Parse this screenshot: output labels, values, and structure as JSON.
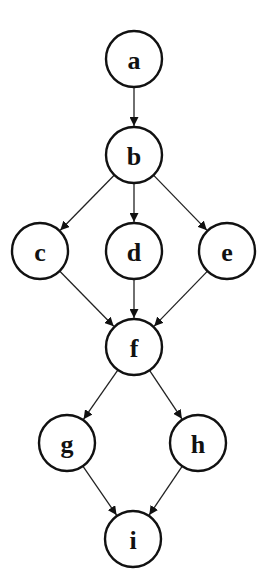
{
  "diagram": {
    "type": "directed-graph",
    "nodes": [
      {
        "id": "a",
        "label": "a",
        "x": 134,
        "y": 59
      },
      {
        "id": "b",
        "label": "b",
        "x": 134,
        "y": 155
      },
      {
        "id": "c",
        "label": "c",
        "x": 40,
        "y": 251
      },
      {
        "id": "d",
        "label": "d",
        "x": 134,
        "y": 251
      },
      {
        "id": "e",
        "label": "e",
        "x": 227,
        "y": 251
      },
      {
        "id": "f",
        "label": "f",
        "x": 134,
        "y": 347
      },
      {
        "id": "g",
        "label": "g",
        "x": 67,
        "y": 443
      },
      {
        "id": "h",
        "label": "h",
        "x": 198,
        "y": 443
      },
      {
        "id": "i",
        "label": "i",
        "x": 133,
        "y": 539
      }
    ],
    "edges": [
      {
        "from": "a",
        "to": "b"
      },
      {
        "from": "b",
        "to": "c"
      },
      {
        "from": "b",
        "to": "d"
      },
      {
        "from": "b",
        "to": "e"
      },
      {
        "from": "c",
        "to": "f"
      },
      {
        "from": "d",
        "to": "f"
      },
      {
        "from": "e",
        "to": "f"
      },
      {
        "from": "f",
        "to": "g"
      },
      {
        "from": "f",
        "to": "h"
      },
      {
        "from": "g",
        "to": "i"
      },
      {
        "from": "h",
        "to": "i"
      }
    ],
    "node_radius": 28,
    "colors": {
      "stroke": "#111111",
      "fill": "#ffffff",
      "background": "#ffffff"
    }
  }
}
